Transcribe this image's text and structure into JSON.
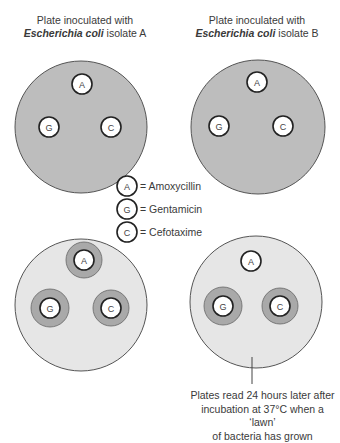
{
  "plates": [
    {
      "id": "plate-a-before",
      "title_line1": "Plate inoculated with",
      "title_species": "Escherichia coli",
      "title_isolate": " isolate A"
    },
    {
      "id": "plate-b-before",
      "title_line1": "Plate inoculated with",
      "title_species": "Escherichia coli",
      "title_isolate": " isolate B"
    }
  ],
  "disc_labels": {
    "a": "A",
    "g": "G",
    "c": "C"
  },
  "legend": [
    {
      "symbol": "A",
      "text": "= Amoxycillin"
    },
    {
      "symbol": "G",
      "text": "= Gentamicin"
    },
    {
      "symbol": "C",
      "text": "= Cefotaxime"
    }
  ],
  "caption": {
    "line1": "Plates read 24 hours later after",
    "line2": "incubation at 37°C when a ‘lawn’",
    "line3": "of bacteria has grown"
  },
  "colors": {
    "plate_inoculated": "#bdbdbd",
    "plate_lawn": "#e6e6e6",
    "inhibition_zone": "#a9a9a9",
    "disc_fill": "#ffffff",
    "outline": "#555555"
  }
}
